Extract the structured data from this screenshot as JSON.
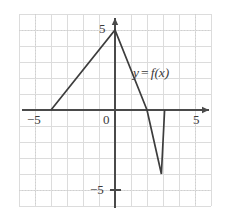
{
  "figure": {
    "width": 226,
    "height": 220,
    "background": "#ffffff",
    "axis_color": "#4a4a4a",
    "grid_color": "#d8d8d8",
    "grid_minor_color": "#ebebeb",
    "curve_color": "#3d3d3d",
    "text_color": "#3b3b3b"
  },
  "labels": {
    "y_pos_5": "5",
    "y_neg_5": "−5",
    "x_neg_5": "−5",
    "x_pos_5": "5",
    "origin": "0",
    "curve_y": "y",
    "curve_eq": "=",
    "curve_fx": "f(x)"
  },
  "chart_data": {
    "type": "line",
    "title": "",
    "xlabel": "",
    "ylabel": "",
    "xlim": [
      -6.0,
      6.4
    ],
    "ylim": [
      -6.4,
      6.0
    ],
    "grid": true,
    "grid_step": 1,
    "legend": "none",
    "annotations": [
      {
        "text": "y = f(x)",
        "x": 1.2,
        "y": 2.4
      }
    ],
    "xticks": [
      -5,
      0,
      5
    ],
    "xtick_labels": [
      "−5",
      "0",
      "5"
    ],
    "yticks": [
      -5,
      5
    ],
    "ytick_labels": [
      "−5",
      "5"
    ],
    "series": [
      {
        "name": "f(x)",
        "piecewise_linear": true,
        "points": [
          {
            "x": -4.0,
            "y": 0.0
          },
          {
            "x": 0.0,
            "y": 5.0
          },
          {
            "x": 2.0,
            "y": 0.0
          },
          {
            "x": 2.0,
            "y": 0.0
          },
          {
            "x": 2.9,
            "y": -4.0
          },
          {
            "x": 3.1,
            "y": 0.0
          }
        ],
        "x": [
          -4.0,
          0.0,
          2.0,
          2.9,
          3.1
        ],
        "values": [
          0.0,
          5.0,
          0.0,
          -4.0,
          0.0
        ]
      }
    ]
  }
}
